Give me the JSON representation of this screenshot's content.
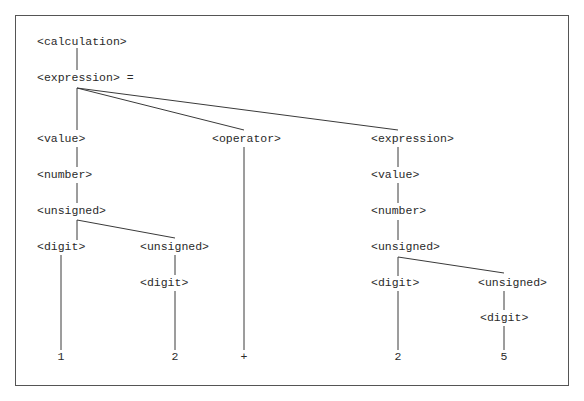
{
  "diagram": {
    "type": "parse-tree",
    "nodes": {
      "calculation": "<calculation>",
      "expression_root": "<expression> =",
      "value_left": "<value>",
      "number_left": "<number>",
      "unsigned_left": "<unsigned>",
      "digit_left": "<digit>",
      "unsigned_left_nested": "<unsigned>",
      "digit_left_nested": "<digit>",
      "operator": "<operator>",
      "expression_right": "<expression>",
      "value_right": "<value>",
      "number_right": "<number>",
      "unsigned_right": "<unsigned>",
      "digit_right": "<digit>",
      "unsigned_right_nested": "<unsigned>",
      "digit_right_nested": "<digit>"
    },
    "leaves": {
      "d1": "1",
      "d2": "2",
      "op": "+",
      "d3": "2",
      "d4": "5"
    },
    "edges": [
      [
        "calculation",
        "expression_root"
      ],
      [
        "expression_root",
        "value_left"
      ],
      [
        "expression_root",
        "operator"
      ],
      [
        "expression_root",
        "expression_right"
      ],
      [
        "value_left",
        "number_left"
      ],
      [
        "number_left",
        "unsigned_left"
      ],
      [
        "unsigned_left",
        "digit_left"
      ],
      [
        "unsigned_left",
        "unsigned_left_nested"
      ],
      [
        "digit_left",
        "1"
      ],
      [
        "unsigned_left_nested",
        "digit_left_nested"
      ],
      [
        "digit_left_nested",
        "2"
      ],
      [
        "operator",
        "+"
      ],
      [
        "expression_right",
        "value_right"
      ],
      [
        "value_right",
        "number_right"
      ],
      [
        "number_right",
        "unsigned_right"
      ],
      [
        "unsigned_right",
        "digit_right"
      ],
      [
        "unsigned_right",
        "unsigned_right_nested"
      ],
      [
        "digit_right",
        "2"
      ],
      [
        "unsigned_right_nested",
        "digit_right_nested"
      ],
      [
        "digit_right_nested",
        "5"
      ]
    ]
  }
}
